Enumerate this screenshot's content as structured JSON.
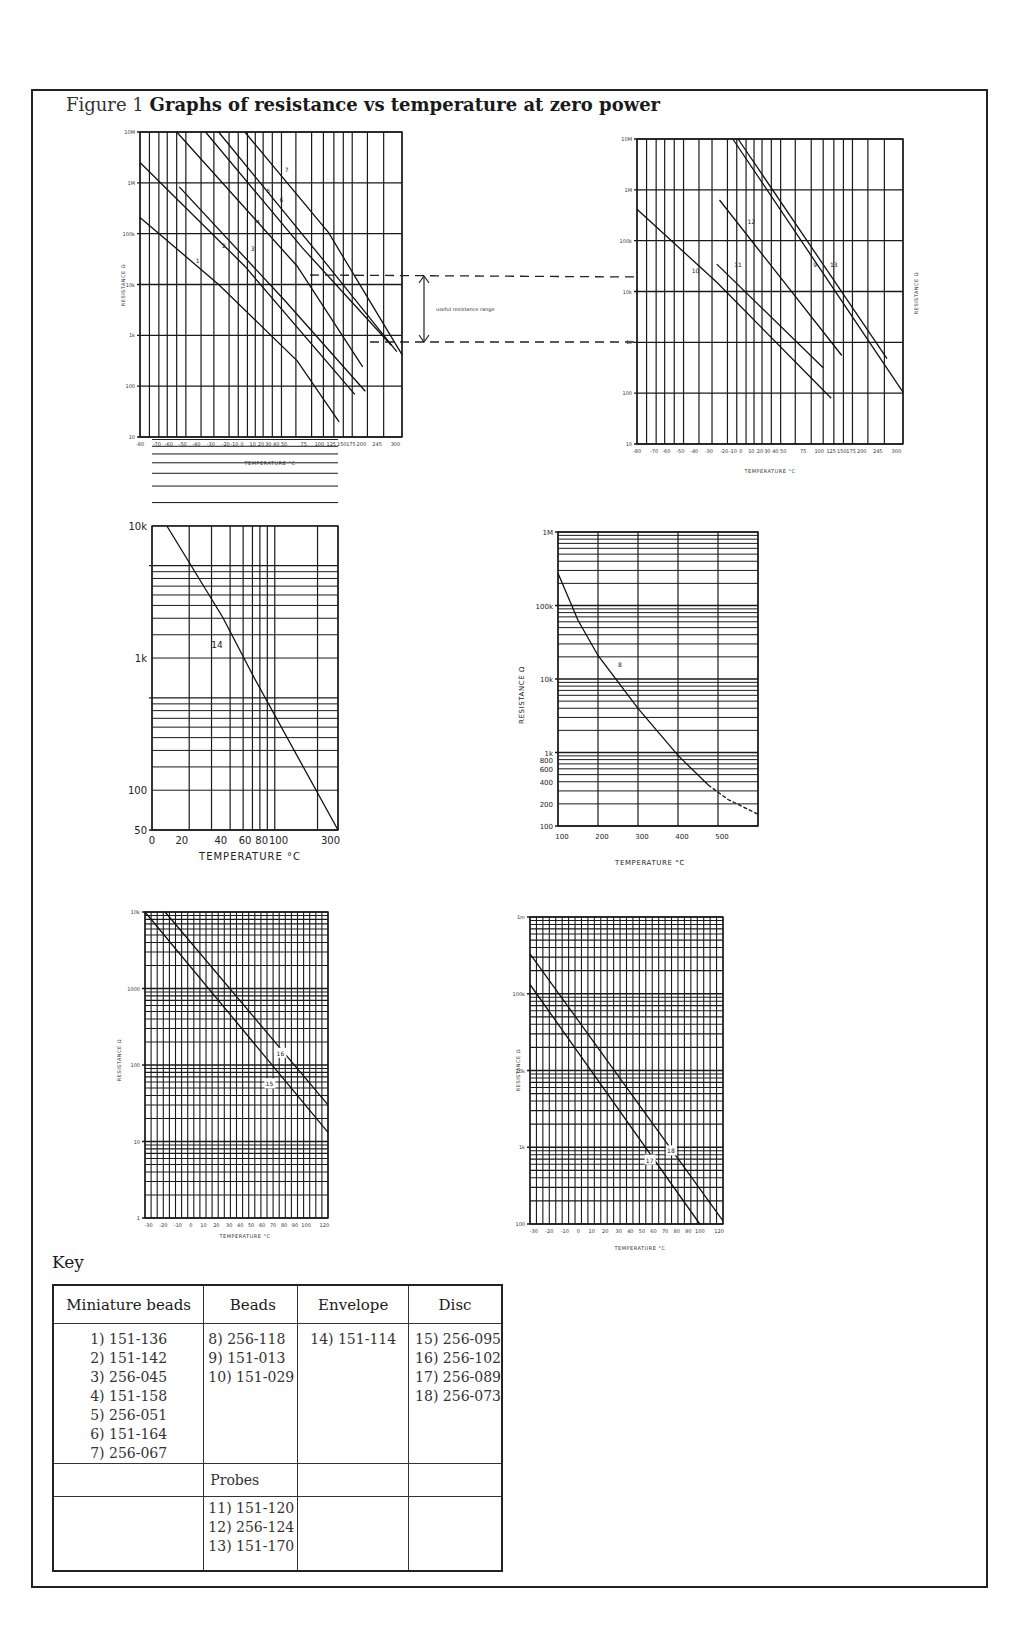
{
  "figure": {
    "number": "Figure 1",
    "title": "Graphs of resistance vs temperature at zero power"
  },
  "chart_data": [
    {
      "id": "chart-1",
      "type": "line",
      "title": "",
      "xlabel": "TEMPERATURE °C",
      "ylabel": "RESISTANCE Ω",
      "yscale": "log",
      "ylim": [
        10,
        10000000
      ],
      "y_ticks": [
        "10M",
        "1M",
        "100k",
        "10k",
        "1k",
        "100",
        "10"
      ],
      "x_ticks": [
        "-80",
        "-70",
        "-60",
        "-50",
        "-40",
        "-30",
        "-20",
        "-10",
        "0",
        "10",
        "20",
        "30",
        "40",
        "50",
        "75",
        "100",
        "125",
        "150",
        "175",
        "200",
        "245",
        "300"
      ],
      "grid": true,
      "annotation": "useful resistance range",
      "useful_range_ohms": [
        1000,
        20000
      ],
      "series": [
        {
          "name": "1",
          "points": [
            [
              -80,
              200000
            ],
            [
              -40,
              20000
            ],
            [
              0,
              3000
            ],
            [
              100,
              80
            ],
            [
              150,
              20
            ]
          ]
        },
        {
          "name": "2",
          "points": [
            [
              -80,
              2000000
            ],
            [
              -40,
              100000
            ],
            [
              -10,
              20000
            ],
            [
              50,
              1000
            ],
            [
              150,
              60
            ]
          ]
        },
        {
          "name": "3",
          "points": [
            [
              -50,
              800000
            ],
            [
              -10,
              100000
            ],
            [
              20,
              20000
            ],
            [
              75,
              1000
            ],
            [
              175,
              80
            ]
          ]
        },
        {
          "name": "4",
          "points": [
            [
              -60,
              10000000
            ],
            [
              -30,
              1000000
            ],
            [
              10,
              100000
            ],
            [
              40,
              20000
            ],
            [
              100,
              1000
            ],
            [
              150,
              200
            ]
          ]
        },
        {
          "name": "5",
          "points": [
            [
              -40,
              10000000
            ],
            [
              0,
              1000000
            ],
            [
              40,
              100000
            ],
            [
              75,
              20000
            ],
            [
              125,
              2000
            ],
            [
              175,
              1000
            ]
          ]
        },
        {
          "name": "6",
          "points": [
            [
              -30,
              10000000
            ],
            [
              20,
              1000000
            ],
            [
              50,
              100000
            ],
            [
              100,
              20000
            ],
            [
              150,
              2000
            ],
            [
              245,
              400
            ]
          ]
        },
        {
          "name": "7",
          "points": [
            [
              -10,
              10000000
            ],
            [
              30,
              1500000
            ],
            [
              75,
              100000
            ],
            [
              125,
              20000
            ],
            [
              200,
              1000
            ],
            [
              300,
              300
            ]
          ]
        }
      ]
    },
    {
      "id": "chart-2",
      "type": "line",
      "title": "",
      "xlabel": "TEMPERATURE °C",
      "ylabel": "RESISTANCE Ω",
      "yscale": "log",
      "ylim": [
        10,
        10000000
      ],
      "y_ticks": [
        "10M",
        "1M",
        "100k",
        "10k",
        "1k",
        "100",
        "10"
      ],
      "x_ticks": [
        "-80",
        "-70",
        "-60",
        "-50",
        "-40",
        "-30",
        "-20",
        "-10",
        "0",
        "10",
        "20",
        "30",
        "40",
        "50",
        "75",
        "100",
        "125",
        "150",
        "175",
        "200",
        "245",
        "300"
      ],
      "grid": true,
      "series": [
        {
          "name": "10",
          "points": [
            [
              -80,
              400000
            ],
            [
              -60,
              100000
            ],
            [
              -40,
              20000
            ],
            [
              0,
              3000
            ],
            [
              100,
              80
            ]
          ]
        },
        {
          "name": "11",
          "points": [
            [
              -30,
              40000
            ],
            [
              -10,
              20000
            ],
            [
              50,
              1000
            ],
            [
              100,
              300
            ]
          ]
        },
        {
          "name": "12",
          "points": [
            [
              -30,
              700000
            ],
            [
              0,
              100000
            ],
            [
              40,
              20000
            ],
            [
              75,
              3000
            ],
            [
              125,
              500
            ]
          ]
        },
        {
          "name": "9",
          "points": [
            [
              -10,
              10000000
            ],
            [
              20,
              1000000
            ],
            [
              50,
              100000
            ],
            [
              100,
              20000
            ],
            [
              175,
              1000
            ],
            [
              245,
              200
            ]
          ]
        },
        {
          "name": "13",
          "points": [
            [
              -10,
              10000000
            ],
            [
              20,
              1000000
            ],
            [
              50,
              100000
            ],
            [
              100,
              20000
            ],
            [
              175,
              1000
            ],
            [
              300,
              100
            ]
          ]
        }
      ]
    },
    {
      "id": "chart-3",
      "type": "line",
      "title": "",
      "xlabel": "TEMPERATURE °C",
      "ylabel": "",
      "yscale": "log",
      "ylim": [
        50,
        10000
      ],
      "y_ticks": [
        "10k",
        "1k",
        "100",
        "50"
      ],
      "x_ticks": [
        "0",
        "20",
        "40",
        "60",
        "80",
        "100",
        "300"
      ],
      "grid": true,
      "series": [
        {
          "name": "14",
          "points": [
            [
              0,
              10000
            ],
            [
              20,
              5000
            ],
            [
              40,
              1000
            ],
            [
              80,
              400
            ],
            [
              300,
              50
            ]
          ]
        }
      ]
    },
    {
      "id": "chart-4",
      "type": "line",
      "title": "",
      "xlabel": "TEMPERATURE °C",
      "ylabel": "RESISTANCE Ω",
      "yscale": "log",
      "ylim": [
        100,
        1000000
      ],
      "y_ticks": [
        "1M",
        "100k",
        "10k",
        "1k",
        "800",
        "600",
        "400",
        "200",
        "100"
      ],
      "x_ticks": [
        "100",
        "200",
        "300",
        "400",
        "500"
      ],
      "grid": true,
      "series": [
        {
          "name": "8",
          "points": [
            [
              100,
              250000
            ],
            [
              200,
              20000
            ],
            [
              250,
              10000
            ],
            [
              300,
              4000
            ],
            [
              400,
              1200
            ],
            [
              500,
              450
            ],
            [
              550,
              350
            ]
          ]
        }
      ]
    },
    {
      "id": "chart-5",
      "type": "line",
      "title": "",
      "xlabel": "TEMPERATURE °C",
      "ylabel": "RESISTANCE Ω",
      "yscale": "log",
      "ylim": [
        1,
        10000
      ],
      "y_ticks": [
        "10k",
        "1000",
        "100",
        "10",
        "1"
      ],
      "x_ticks": [
        "-30",
        "-20",
        "-10",
        "0",
        "10",
        "20",
        "30",
        "40",
        "50",
        "60",
        "70",
        "80",
        "90",
        "100",
        "120"
      ],
      "grid": true,
      "series": [
        {
          "name": "15",
          "points": [
            [
              -30,
              9000
            ],
            [
              0,
              1000
            ],
            [
              60,
              60
            ],
            [
              120,
              12
            ]
          ]
        },
        {
          "name": "16",
          "points": [
            [
              -20,
              9000
            ],
            [
              20,
              1000
            ],
            [
              80,
              80
            ],
            [
              120,
              25
            ]
          ]
        }
      ]
    },
    {
      "id": "chart-6",
      "type": "line",
      "title": "",
      "xlabel": "TEMPERATURE °C",
      "ylabel": "RESISTANCE Ω",
      "yscale": "log",
      "ylim": [
        100,
        1000000
      ],
      "y_ticks": [
        "1m",
        "100k",
        "10k",
        "1k",
        "100"
      ],
      "x_ticks": [
        "-30",
        "-20",
        "-10",
        "0",
        "10",
        "20",
        "30",
        "40",
        "50",
        "60",
        "70",
        "80",
        "90",
        "100",
        "120"
      ],
      "grid": true,
      "series": [
        {
          "name": "17",
          "points": [
            [
              -30,
              120000
            ],
            [
              0,
              20000
            ],
            [
              60,
              1000
            ],
            [
              110,
              100
            ]
          ]
        },
        {
          "name": "18",
          "points": [
            [
              -30,
              300000
            ],
            [
              10,
              20000
            ],
            [
              80,
              1000
            ],
            [
              120,
              100
            ]
          ]
        }
      ]
    }
  ],
  "charts": {
    "c1": {
      "y_ticks": [
        "10M",
        "1M",
        "100k",
        "10k",
        "1k",
        "100",
        "10"
      ],
      "x_ticks": [
        "-80",
        "-70",
        "-60",
        "-50",
        "-40",
        "-30",
        "-20",
        "-10",
        "0",
        "10",
        "20",
        "30",
        "40",
        "50",
        "75",
        "100",
        "125",
        "150",
        "175",
        "200",
        "245",
        "300"
      ],
      "xlabel": "TEMPERATURE °C",
      "ylabel": "RESISTANCE Ω",
      "curve_labels": [
        "1",
        "2",
        "3",
        "4",
        "5",
        "6",
        "7"
      ],
      "annotation": "useful resistance range"
    },
    "c2": {
      "y_ticks": [
        "10M",
        "1M",
        "100k",
        "10k",
        "1k",
        "100",
        "10"
      ],
      "x_ticks": [
        "-80",
        "-70",
        "-60",
        "-50",
        "-40",
        "-30",
        "-20",
        "-10",
        "0",
        "10",
        "20",
        "30",
        "40",
        "50",
        "75",
        "100",
        "125",
        "150",
        "175",
        "200",
        "245",
        "300"
      ],
      "xlabel": "TEMPERATURE °C",
      "ylabel": "RESISTANCE Ω",
      "curve_labels": [
        "10",
        "11",
        "12",
        "9",
        "13"
      ]
    },
    "c3": {
      "y_ticks": [
        "10k",
        "1k",
        "100",
        "50"
      ],
      "x_ticks": [
        "0",
        "20",
        "40",
        "60",
        "80",
        "100",
        "300"
      ],
      "xlabel": "TEMPERATURE °C",
      "curve_labels": [
        "14"
      ]
    },
    "c4": {
      "y_ticks": [
        "1M",
        "100k",
        "10k",
        "1k",
        "800",
        "600",
        "400",
        "200",
        "100"
      ],
      "x_ticks": [
        "100",
        "200",
        "300",
        "400",
        "500"
      ],
      "xlabel": "TEMPERATURE °C",
      "ylabel": "RESISTANCE Ω",
      "curve_labels": [
        "8"
      ]
    },
    "c5": {
      "y_ticks": [
        "10k",
        "1000",
        "100",
        "10",
        "1"
      ],
      "x_ticks": [
        "-30",
        "-20",
        "-10",
        "0",
        "10",
        "20",
        "30",
        "40",
        "50",
        "60",
        "70",
        "80",
        "90",
        "100",
        "120"
      ],
      "xlabel": "TEMPERATURE °C",
      "ylabel": "RESISTANCE Ω",
      "curve_labels": [
        "15",
        "16"
      ]
    },
    "c6": {
      "y_ticks": [
        "1m",
        "100k",
        "10k",
        "1k",
        "100"
      ],
      "x_ticks": [
        "-30",
        "-20",
        "-10",
        "0",
        "10",
        "20",
        "30",
        "40",
        "50",
        "60",
        "70",
        "80",
        "90",
        "100",
        "120"
      ],
      "xlabel": "TEMPERATURE °C",
      "ylabel": "RESISTANCE Ω",
      "curve_labels": [
        "17",
        "18"
      ]
    }
  },
  "key": {
    "title": "Key",
    "headers": [
      "Miniature beads",
      "Beads",
      "Envelope",
      "Disc"
    ],
    "miniature_beads": [
      "1) 151-136",
      "2) 151-142",
      "3) 256-045",
      "4) 151-158",
      "5) 256-051",
      "6) 151-164",
      "7) 256-067"
    ],
    "beads": [
      "8) 256-118",
      "9) 151-013",
      "10) 151-029"
    ],
    "envelope": [
      "14) 151-114"
    ],
    "disc": [
      "15) 256-095",
      "16) 256-102",
      "17) 256-089",
      "18) 256-073"
    ],
    "probes_header": "Probes",
    "probes": [
      "11) 151-120",
      "12) 256-124",
      "13) 151-170"
    ]
  }
}
